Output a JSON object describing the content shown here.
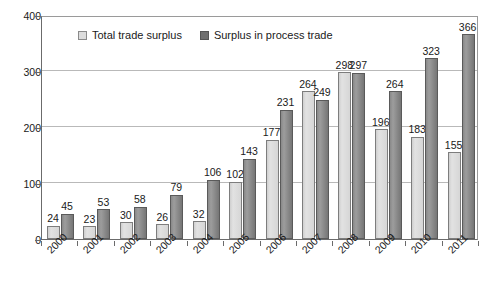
{
  "chart_data": {
    "type": "bar",
    "title": "",
    "xlabel": "",
    "ylabel": "",
    "ylim": [
      0,
      400
    ],
    "yticks": [
      0,
      100,
      200,
      300,
      400
    ],
    "grid": true,
    "legend_position": "top-center",
    "categories": [
      "2000",
      "2001",
      "2002",
      "2003",
      "2004",
      "2005",
      "2006",
      "2007",
      "2008",
      "2009",
      "2010",
      "2011"
    ],
    "series": [
      {
        "name": "Total trade surplus",
        "color": "#d9d9d9",
        "values": [
          24,
          23,
          30,
          26,
          32,
          102,
          177,
          264,
          298,
          196,
          183,
          155
        ]
      },
      {
        "name": "Surplus in process trade",
        "color": "#7f7f7f",
        "values": [
          45,
          53,
          58,
          79,
          106,
          143,
          231,
          249,
          297,
          264,
          323,
          366
        ]
      }
    ]
  },
  "legend": {
    "entries": [
      {
        "label": "Total trade surplus",
        "swatch": "light-square-icon"
      },
      {
        "label": "Surplus in process trade",
        "swatch": "dark-square-icon"
      }
    ]
  },
  "axes": {
    "y_tick_labels": [
      "400",
      "300",
      "200",
      "100",
      "0"
    ],
    "x_tick_labels": [
      "2000",
      "2001",
      "2002",
      "2003",
      "2004",
      "2005",
      "2006",
      "2007",
      "2008",
      "2009",
      "2010",
      "2011"
    ]
  }
}
